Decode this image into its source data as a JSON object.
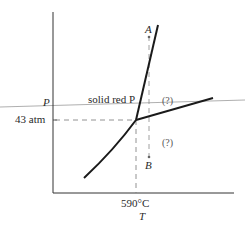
{
  "diagram": {
    "type": "phase-diagram",
    "axes": {
      "y_label": "P",
      "x_label": "T",
      "y_tick": "43 atm",
      "x_tick": "590°C"
    },
    "labels": {
      "line_label": "solid red P",
      "region_upper_right": "(?)",
      "region_lower_right": "(?)",
      "point_a": "A",
      "point_b": "B"
    },
    "triple_point": {
      "T": "590°C",
      "P": "43 atm"
    },
    "colors": {
      "curve": "#1a1a1a",
      "axis": "#333333",
      "dashed": "#777777",
      "reference_line": "#999999"
    }
  }
}
